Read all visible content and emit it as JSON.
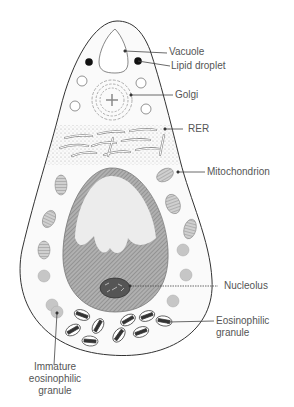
{
  "labels": {
    "vacuole": "Vacuole",
    "lipid_droplet": "Lipid droplet",
    "golgi": "Golgi",
    "rer": "RER",
    "mitochondrion": "Mitochondrion",
    "nucleolus": "Nucleolus",
    "eosinophilic_granule_1": "Eosinophilic",
    "eosinophilic_granule_2": "granule",
    "immature_1": "Immature",
    "immature_2": "eosinophilic",
    "immature_3": "granule"
  },
  "colors": {
    "outline": "#333333",
    "label_text": "#555555",
    "nucleus_dark": "#8a8a8a",
    "nucleus_light": "#e6e6e6",
    "stipple": "#9a9a9a",
    "lipid": "#111111"
  }
}
